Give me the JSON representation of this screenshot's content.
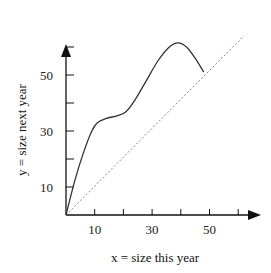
{
  "chart_data": {
    "type": "line",
    "title": "",
    "xlabel": "x = size this year",
    "ylabel": "y = size next year",
    "xlim": [
      0,
      62
    ],
    "ylim": [
      0,
      64
    ],
    "x_ticks": [
      10,
      20,
      30,
      40,
      50,
      60
    ],
    "x_tick_labels": [
      "10",
      "",
      "30",
      "",
      "50",
      ""
    ],
    "y_ticks": [
      10,
      20,
      30,
      40,
      50,
      60
    ],
    "y_tick_labels": [
      "10",
      "",
      "30",
      "",
      "50",
      ""
    ],
    "grid": false,
    "legend": null,
    "series": [
      {
        "name": "growth curve",
        "style": "solid",
        "x": [
          0,
          3,
          6,
          9,
          11,
          14,
          18,
          21,
          24,
          28,
          32,
          36,
          39,
          42,
          45,
          48
        ],
        "y": [
          0,
          12,
          22,
          30,
          33,
          34.5,
          35.5,
          37,
          41,
          48,
          55,
          60,
          61.5,
          60,
          56,
          51
        ]
      },
      {
        "name": "y = x",
        "style": "dotted",
        "x": [
          0,
          62
        ],
        "y": [
          0,
          64
        ]
      }
    ]
  },
  "colors": {
    "axis": "#111111",
    "curve": "#333333",
    "diagonal": "#888888"
  }
}
